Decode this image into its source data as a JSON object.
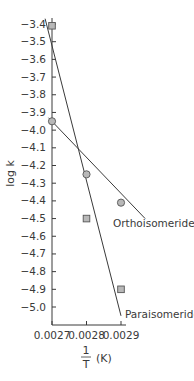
{
  "chart_data": {
    "type": "scatter",
    "title": "",
    "xlabel": "1/T (K)",
    "xlabel_parts": {
      "numerator": "1",
      "denominator": "T",
      "unit": "(K)"
    },
    "ylabel": "log k",
    "xlim": [
      0.0027,
      0.00293
    ],
    "ylim": [
      -5.1,
      -3.35
    ],
    "x_ticks": [
      0.0027,
      0.0028,
      0.0029
    ],
    "x_tick_labels": [
      "0.0027",
      "0.0028",
      "0.0029"
    ],
    "y_ticks": [
      -3.4,
      -3.5,
      -3.6,
      -3.7,
      -3.8,
      -3.9,
      -4.0,
      -4.1,
      -4.2,
      -4.3,
      -4.4,
      -4.5,
      -4.6,
      -4.7,
      -4.8,
      -4.9,
      -5.0
    ],
    "y_tick_labels": [
      "-3.4",
      "-3.5",
      "-3.6",
      "-3.7",
      "-3.8",
      "-3.9",
      "-4.0",
      "-4.1",
      "-4.2",
      "-4.3",
      "-4.4",
      "-4.5",
      "-4.6",
      "-4.7",
      "-4.8",
      "-4.9",
      "-5.0"
    ],
    "grid": false,
    "legend": "inline labels",
    "series": [
      {
        "name": "Orthoisomeride",
        "marker": "circle",
        "x": [
          0.0027,
          0.0028,
          0.0029
        ],
        "y": [
          -3.95,
          -4.25,
          -4.41
        ],
        "fit_line": {
          "x": [
            0.00269,
            0.00297
          ],
          "y": [
            -3.93,
            -4.5
          ]
        }
      },
      {
        "name": "Paraisomeride",
        "marker": "square",
        "x": [
          0.0027,
          0.0028,
          0.0029
        ],
        "y": [
          -3.41,
          -4.5,
          -4.9
        ],
        "fit_line": {
          "x": [
            0.00268,
            0.0029
          ],
          "y": [
            -3.37,
            -5.05
          ]
        }
      }
    ],
    "annotations": [
      {
        "text": "Orthoisomeride",
        "near_series": "Orthoisomeride"
      },
      {
        "text": "Paraisomeride",
        "near_series": "Paraisomeride"
      }
    ]
  },
  "style": {
    "line_color": "#3a3a3a",
    "marker_fill": "#b8b8b8",
    "marker_stroke": "#555555",
    "axis_color": "#3a3a3a"
  }
}
